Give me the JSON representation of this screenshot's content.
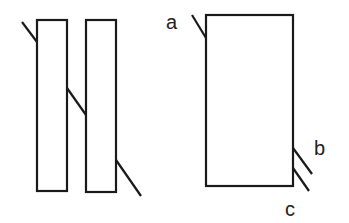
{
  "diagram": {
    "stroke_color": "#1a1a1a",
    "background": "#ffffff",
    "left_figure": {
      "description": "Two tall rectangles joined by diagonal connecting strokes",
      "rectangles": [
        {
          "x": 37,
          "y": 20,
          "w": 30,
          "h": 171
        },
        {
          "x": 86,
          "y": 20,
          "w": 30,
          "h": 172
        }
      ],
      "strokes": [
        {
          "x1": 22,
          "y1": 22,
          "x2": 37,
          "y2": 42
        },
        {
          "x1": 67,
          "y1": 88,
          "x2": 86,
          "y2": 115
        },
        {
          "x1": 116,
          "y1": 160,
          "x2": 141,
          "y2": 196
        }
      ]
    },
    "right_figure": {
      "description": "Single rectangle with labeled terminal strokes",
      "rectangle": {
        "x": 206,
        "y": 15,
        "w": 87,
        "h": 171
      },
      "labels": {
        "a": "a",
        "b": "b",
        "c": "c"
      },
      "strokes": [
        {
          "name": "a",
          "x1": 192,
          "y1": 15,
          "x2": 206,
          "y2": 38
        },
        {
          "name": "b",
          "x1": 293,
          "y1": 148,
          "x2": 312,
          "y2": 174
        },
        {
          "name": "c",
          "x1": 293,
          "y1": 168,
          "x2": 309,
          "y2": 191
        }
      ]
    }
  }
}
